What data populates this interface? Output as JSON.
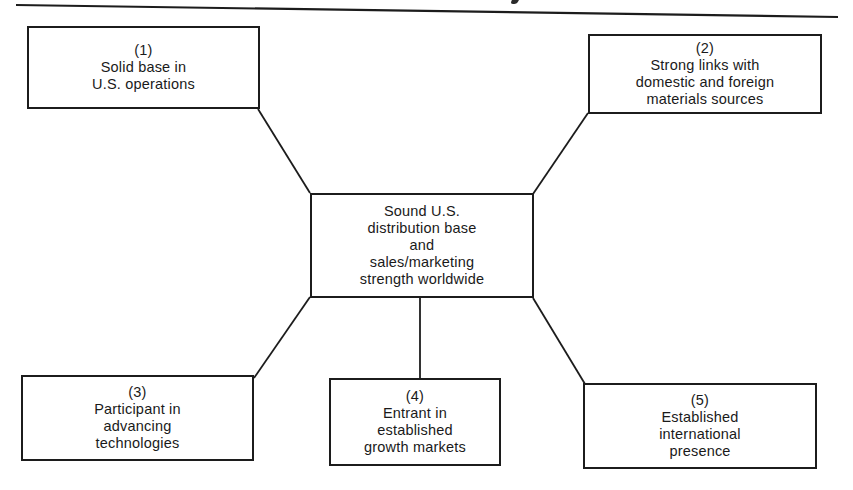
{
  "diagram": {
    "type": "hub-and-spoke",
    "header_rule": true,
    "center": {
      "lines": [
        "Sound U.S.",
        "distribution base",
        "and",
        "sales/marketing",
        "strength worldwide"
      ]
    },
    "nodes": [
      {
        "number": "(1)",
        "lines": [
          "Solid base in",
          "U.S. operations"
        ]
      },
      {
        "number": "(2)",
        "lines": [
          "Strong links with",
          "domestic and foreign",
          "materials sources"
        ]
      },
      {
        "number": "(3)",
        "lines": [
          "Participant in",
          "advancing",
          "technologies"
        ]
      },
      {
        "number": "(4)",
        "lines": [
          "Entrant in",
          "established",
          "growth markets"
        ]
      },
      {
        "number": "(5)",
        "lines": [
          "Established",
          "international",
          "presence"
        ]
      }
    ],
    "edges": [
      {
        "from": "center",
        "to": "node-1"
      },
      {
        "from": "center",
        "to": "node-2"
      },
      {
        "from": "center",
        "to": "node-3"
      },
      {
        "from": "center",
        "to": "node-4"
      },
      {
        "from": "center",
        "to": "node-5"
      }
    ],
    "colors": {
      "ink": "#1c1c1c",
      "paper": "#ffffff"
    }
  }
}
